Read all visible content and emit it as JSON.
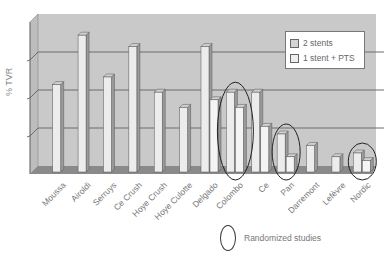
{
  "chart_data": {
    "type": "bar",
    "title": "",
    "xlabel": "",
    "ylabel": "% TVR",
    "ylim": [
      0,
      4
    ],
    "grid": true,
    "style": "3d",
    "legend_position": "upper-right",
    "categories": [
      "Moussa",
      "Airoldi",
      "Serruys",
      "Ce Crush",
      "Hoye Crush",
      "Hoye Culotte",
      "Delgado",
      "Colombo",
      "Ce",
      "Pan",
      "Darremont",
      "Lefèvre",
      "Nordic"
    ],
    "series": [
      {
        "name": "2 stents",
        "values": [
          2.3,
          3.6,
          2.5,
          3.3,
          2.1,
          1.7,
          3.3,
          2.1,
          2.1,
          1.0,
          0.7,
          0.4,
          0.5
        ]
      },
      {
        "name": "1 stent + PTS",
        "values": [
          null,
          null,
          null,
          null,
          null,
          null,
          1.9,
          1.7,
          1.2,
          0.4,
          null,
          null,
          0.3
        ]
      }
    ],
    "annotations": [
      {
        "type": "ellipse",
        "label": "Randomized studies",
        "categories": [
          "Colombo",
          "Pan",
          "Nordic"
        ]
      }
    ]
  },
  "legend": {
    "items": [
      {
        "label": "2 stents",
        "color": "#d4d4d4"
      },
      {
        "label": "1 stent + PTS",
        "color": "#eeeeee"
      }
    ]
  },
  "annotation_legend": {
    "label": "Randomized studies"
  },
  "colors": {
    "plot_bg": "#c9c9c9",
    "floor": "#8a8a8a",
    "grid": "#6d6d6d",
    "bar_front": "#ececec",
    "bar_side": "#9a9a9a",
    "bar_top": "#cfcfcf"
  }
}
